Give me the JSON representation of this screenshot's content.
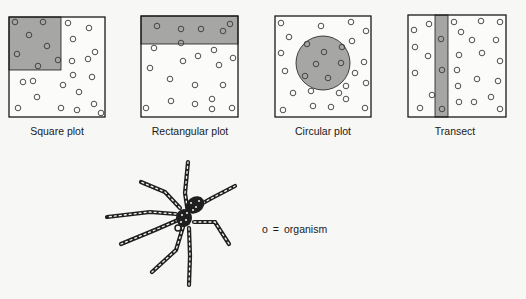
{
  "colors": {
    "background": "#f7f7f5",
    "stroke": "#1a1a1a",
    "sample_fill": "#a6a6a4",
    "plot_fill": "#fbfbfa",
    "organism_stroke": "#3a3a3a"
  },
  "plots": [
    {
      "id": "square",
      "label": "Square plot",
      "label_x": 57,
      "box": {
        "x": 9,
        "y": 17,
        "w": 96,
        "h": 100
      },
      "sample": {
        "shape": "rect",
        "x": 9,
        "y": 17,
        "w": 52,
        "h": 53
      },
      "organisms": [
        [
          15,
          22
        ],
        [
          43,
          22
        ],
        [
          29,
          35
        ],
        [
          47,
          46
        ],
        [
          17,
          54
        ],
        [
          38,
          66
        ],
        [
          58,
          60
        ],
        [
          68,
          23
        ],
        [
          89,
          28
        ],
        [
          73,
          39
        ],
        [
          95,
          52
        ],
        [
          72,
          61
        ],
        [
          88,
          59
        ],
        [
          73,
          75
        ],
        [
          92,
          77
        ],
        [
          23,
          82
        ],
        [
          33,
          81
        ],
        [
          63,
          85
        ],
        [
          79,
          92
        ],
        [
          37,
          97
        ],
        [
          18,
          108
        ],
        [
          61,
          108
        ],
        [
          77,
          110
        ],
        [
          94,
          104
        ],
        [
          101,
          113
        ]
      ]
    },
    {
      "id": "rectangular",
      "label": "Rectangular plot",
      "label_x": 190,
      "box": {
        "x": 141,
        "y": 16,
        "w": 97,
        "h": 101
      },
      "sample": {
        "shape": "rect",
        "x": 141,
        "y": 16,
        "w": 97,
        "h": 28
      },
      "organisms": [
        [
          157,
          26
        ],
        [
          181,
          29
        ],
        [
          201,
          29
        ],
        [
          223,
          31
        ],
        [
          230,
          24
        ],
        [
          154,
          48
        ],
        [
          181,
          43
        ],
        [
          198,
          56
        ],
        [
          214,
          50
        ],
        [
          183,
          61
        ],
        [
          219,
          65
        ],
        [
          233,
          58
        ],
        [
          150,
          68
        ],
        [
          170,
          79
        ],
        [
          195,
          85
        ],
        [
          223,
          85
        ],
        [
          171,
          101
        ],
        [
          195,
          104
        ],
        [
          212,
          99
        ],
        [
          146,
          108
        ],
        [
          212,
          109
        ],
        [
          232,
          108
        ]
      ]
    },
    {
      "id": "circular",
      "label": "Circular plot",
      "label_x": 323,
      "box": {
        "x": 275,
        "y": 16,
        "w": 96,
        "h": 101
      },
      "sample": {
        "shape": "circle",
        "cx": 323,
        "cy": 63,
        "r": 27
      },
      "organisms": [
        [
          281,
          23
        ],
        [
          321,
          26
        ],
        [
          351,
          22
        ],
        [
          366,
          31
        ],
        [
          289,
          37
        ],
        [
          307,
          44
        ],
        [
          324,
          52
        ],
        [
          342,
          47
        ],
        [
          352,
          41
        ],
        [
          281,
          53
        ],
        [
          316,
          64
        ],
        [
          341,
          63
        ],
        [
          364,
          62
        ],
        [
          285,
          71
        ],
        [
          305,
          76
        ],
        [
          328,
          78
        ],
        [
          355,
          73
        ],
        [
          366,
          83
        ],
        [
          346,
          86
        ],
        [
          293,
          93
        ],
        [
          311,
          91
        ],
        [
          339,
          93
        ],
        [
          346,
          99
        ],
        [
          283,
          110
        ],
        [
          313,
          106
        ],
        [
          331,
          107
        ],
        [
          365,
          108
        ]
      ]
    },
    {
      "id": "transect",
      "label": "Transect",
      "label_x": 455,
      "box": {
        "x": 408,
        "y": 15,
        "w": 98,
        "h": 102
      },
      "sample": {
        "shape": "rect",
        "x": 435,
        "y": 15,
        "w": 13,
        "h": 102
      },
      "organisms": [
        [
          429,
          24
        ],
        [
          414,
          30
        ],
        [
          454,
          22
        ],
        [
          481,
          21
        ],
        [
          500,
          22
        ],
        [
          461,
          32
        ],
        [
          472,
          40
        ],
        [
          496,
          40
        ],
        [
          441,
          39
        ],
        [
          415,
          47
        ],
        [
          428,
          56
        ],
        [
          459,
          55
        ],
        [
          482,
          53
        ],
        [
          500,
          61
        ],
        [
          442,
          70
        ],
        [
          415,
          73
        ],
        [
          457,
          70
        ],
        [
          477,
          79
        ],
        [
          498,
          81
        ],
        [
          458,
          86
        ],
        [
          432,
          95
        ],
        [
          491,
          97
        ],
        [
          420,
          108
        ],
        [
          442,
          109
        ],
        [
          459,
          102
        ],
        [
          474,
          102
        ],
        [
          500,
          109
        ]
      ]
    }
  ],
  "legend": {
    "symbol": "o",
    "equals": "=",
    "text": "organism"
  },
  "illustration": {
    "subject": "spider"
  }
}
